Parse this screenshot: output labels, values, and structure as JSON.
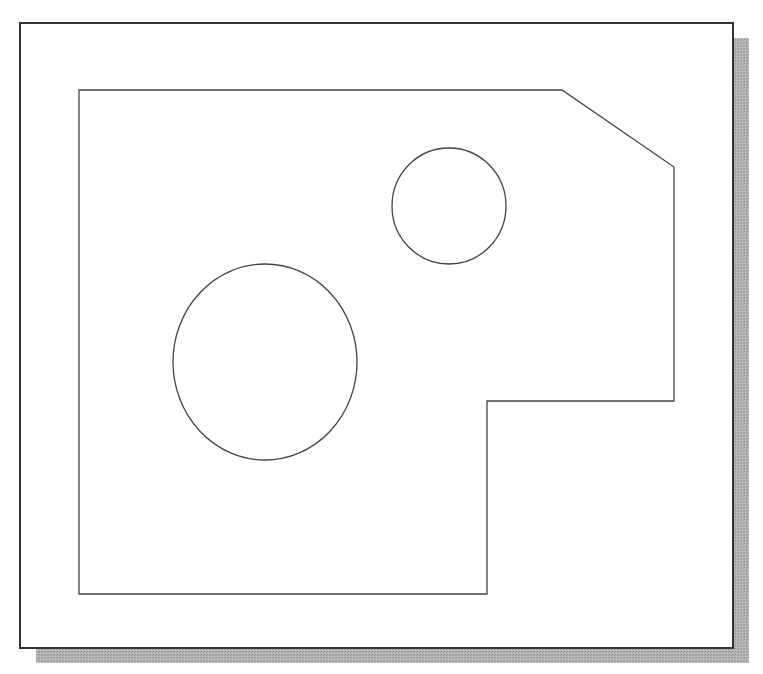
{
  "diagram": {
    "type": "cad-2d-part-outline",
    "background": "#ffffff",
    "frame": {
      "x": 20,
      "y": 23,
      "width": 713,
      "height": 625,
      "stroke": "#333333",
      "stroke_width": 2,
      "shadow": {
        "offset_x": 16,
        "offset_y": 15,
        "color": "#a8a8a8"
      }
    },
    "part_outline": {
      "stroke": "#444444",
      "stroke_width": 1.3,
      "points": [
        [
          79,
          90
        ],
        [
          562,
          90
        ],
        [
          674,
          167
        ],
        [
          674,
          401
        ],
        [
          487,
          401
        ],
        [
          487,
          594
        ],
        [
          79,
          594
        ]
      ]
    },
    "holes": [
      {
        "name": "small-hole",
        "cx": 449,
        "cy": 206,
        "rx": 57,
        "ry": 58
      },
      {
        "name": "large-hole",
        "cx": 265,
        "cy": 362,
        "rx": 92,
        "ry": 98
      }
    ]
  }
}
